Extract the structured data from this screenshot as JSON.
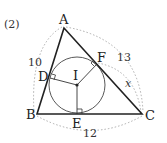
{
  "problem_number": "(2)",
  "points": {
    "A": "A",
    "B": "B",
    "C": "C",
    "D": "D",
    "E": "E",
    "F": "F",
    "I": "I"
  },
  "measures": {
    "AB": "10",
    "AC": "13",
    "BC": "12",
    "FC": "x"
  }
}
